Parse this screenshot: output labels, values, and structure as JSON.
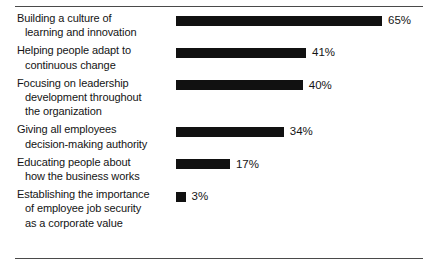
{
  "chart_data": {
    "type": "bar",
    "orientation": "horizontal",
    "title": "",
    "subtitle": "",
    "xlabel": "",
    "ylabel": "",
    "xlim": [
      0,
      65
    ],
    "grid": false,
    "legend": false,
    "value_suffix": "%",
    "categories": [
      "Building a culture of learning and innovation",
      "Helping people adapt to continuous change",
      "Focusing on leadership development throughout the organization",
      "Giving all employees decision-making authority",
      "Educating people about how the business works",
      "Establishing the importance of employee job security as a corporate value"
    ],
    "values": [
      65,
      41,
      40,
      34,
      17,
      3
    ],
    "value_labels": [
      "65%",
      "41%",
      "40%",
      "34%",
      "17%",
      "3%"
    ],
    "bar_color": "#111111",
    "rule_color": "#4a4a4a",
    "background_color": "#ffffff"
  },
  "rows": [
    {
      "lines": [
        "Building a culture of",
        "learning and innovation"
      ],
      "value": 65,
      "value_label": "65%"
    },
    {
      "lines": [
        "Helping people adapt to",
        "continuous change"
      ],
      "value": 41,
      "value_label": "41%"
    },
    {
      "lines": [
        "Focusing on leadership",
        "development throughout",
        "the organization"
      ],
      "value": 40,
      "value_label": "40%"
    },
    {
      "lines": [
        "Giving all employees",
        "decision-making authority"
      ],
      "value": 34,
      "value_label": "34%"
    },
    {
      "lines": [
        "Educating people about",
        "how the business works"
      ],
      "value": 17,
      "value_label": "17%"
    },
    {
      "lines": [
        "Establishing the importance",
        "of employee job security",
        "as a corporate value"
      ],
      "value": 3,
      "value_label": "3%"
    }
  ]
}
